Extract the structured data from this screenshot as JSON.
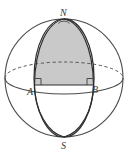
{
  "figure": {
    "kind": "sphere-lune-diagram",
    "background_color": "#ffffff",
    "outline_color": "#4a4a4a",
    "meridian_color": "#2e2e2e",
    "dashed_color": "#555555",
    "shade_color": "#c9c9c9",
    "shade_edge_color": "#4a4a4a",
    "label_color": "#3a3a3a",
    "labels": {
      "north_pole": "N",
      "south_pole": "S",
      "equator_left": "A",
      "equator_right": "B"
    },
    "geometry": {
      "center_x": 64,
      "center_y": 78,
      "radius": 59,
      "equator_semi_minor": 16,
      "north_pole_x": 64,
      "north_pole_y": 19,
      "south_pole_x": 64,
      "south_pole_y": 137,
      "point_a_x": 34,
      "point_a_y": 85,
      "point_b_x": 94,
      "point_b_y": 85,
      "lune_left_meridian_semi_major": 30,
      "lune_right_meridian_semi_major": 30
    },
    "markers": {
      "right_angle_a": "right-angle-square",
      "right_angle_b": "right-angle-square"
    }
  }
}
